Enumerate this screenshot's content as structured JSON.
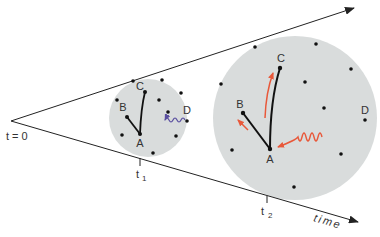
{
  "labels": {
    "origin": "t = 0",
    "t1": "t",
    "t1_sub": "1",
    "t2": "t",
    "t2_sub": "2",
    "axis": "time",
    "small_A": "A",
    "small_B": "B",
    "small_C": "C",
    "small_D": "D",
    "large_A": "A",
    "large_B": "B",
    "large_C": "C",
    "large_D": "D"
  },
  "colors": {
    "circle_fill": "#d9dcdc",
    "line": "#222222",
    "red_arrow": "#e8583a",
    "blue_wave": "#5a4fa0",
    "text": "#333333"
  },
  "icons": {
    "wave_small": "wavy-arrow-blue",
    "wave_large": "wavy-arrow-red"
  }
}
